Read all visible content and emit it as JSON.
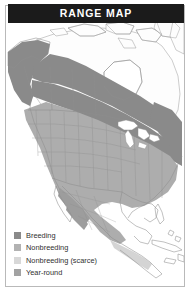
{
  "card": {
    "header": {
      "title": "RANGE MAP"
    },
    "frame_color": "#b9b9b9",
    "header_bg": "#1b1b1b",
    "header_text_color": "#ffffff",
    "background": "#ffffff"
  },
  "map": {
    "region": "North America",
    "land_outline_color": "#8e8e8e",
    "border_line_color": "#9a9a9a",
    "water_color": "#ffffff",
    "unshaded_land_color": "#fdfdfd",
    "areas": [
      {
        "name": "breeding-band",
        "shade": "#8a8a8a",
        "description": "Alaska, western British Columbia and a diagonal band across central and southern Canada to Labrador"
      },
      {
        "name": "nonbreeding-area",
        "shade": "#adadad",
        "description": "Contiguous United States and most of Mexico"
      },
      {
        "name": "nonbreeding-scarce-area",
        "shade": "#d4d4d4",
        "description": "Southern Mexico and Central America fringe"
      },
      {
        "name": "year-round-area",
        "shade": "#9d9d9d",
        "description": "Sierra Madre of northwestern Mexico"
      }
    ]
  },
  "legend": {
    "items": [
      {
        "label": "Breeding",
        "color": "#8a8a8a"
      },
      {
        "label": "Nonbreeding",
        "color": "#b2b2b2"
      },
      {
        "label": "Nonbreeding (scarce)",
        "color": "#d8d8d8"
      },
      {
        "label": "Year-round",
        "color": "#a2a2a2"
      }
    ]
  }
}
